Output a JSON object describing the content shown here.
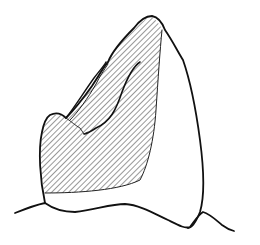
{
  "figure": {
    "description": "Line drawing of a tooth-like object with a diagonally hatched face resting on an undulating base line",
    "stroke_color": "#111111",
    "background": "#ffffff",
    "hatch": {
      "color": "#333333",
      "angle_deg": -45,
      "spacing_px": 4
    }
  }
}
